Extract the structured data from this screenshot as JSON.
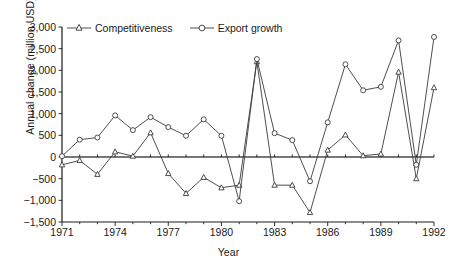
{
  "chart_data": {
    "type": "line",
    "title": "",
    "xlabel": "Year",
    "ylabel": "Annual change (million USD)",
    "xlim": [
      1971,
      1992
    ],
    "ylim": [
      -1500,
      3000
    ],
    "yticks": [
      3000,
      2500,
      2000,
      1500,
      1000,
      500,
      0,
      -500,
      -1000,
      -1500
    ],
    "ytick_labels": [
      "3,000",
      "2,500",
      "2,000",
      "1,500",
      "1,000",
      "500",
      "0",
      "−500",
      "−1,000",
      "−1,500"
    ],
    "xticks": [
      1971,
      1974,
      1977,
      1980,
      1983,
      1986,
      1989,
      1992
    ],
    "xtick_labels": [
      "1971",
      "1974",
      "1977",
      "1980",
      "1983",
      "1986",
      "1989",
      "1992"
    ],
    "grid": false,
    "legend_position": "top-left",
    "zero_line": 0,
    "x": [
      1971,
      1972,
      1973,
      1974,
      1975,
      1976,
      1977,
      1978,
      1979,
      1980,
      1981,
      1982,
      1983,
      1984,
      1985,
      1986,
      1987,
      1988,
      1989,
      1990,
      1991,
      1992
    ],
    "series": [
      {
        "name": "Competitiveness",
        "marker": "triangle",
        "color": "#3a3a3a",
        "values": [
          -180,
          -80,
          -400,
          120,
          20,
          560,
          -380,
          -840,
          -470,
          -710,
          -650,
          2200,
          -650,
          -650,
          -1280,
          160,
          510,
          30,
          70,
          1960,
          -500,
          1600
        ]
      },
      {
        "name": "Export growth",
        "marker": "circle",
        "color": "#3a3a3a",
        "values": [
          20,
          400,
          450,
          960,
          620,
          920,
          690,
          490,
          870,
          490,
          -1020,
          2260,
          550,
          390,
          -560,
          800,
          2140,
          1540,
          1620,
          2690,
          -180,
          2770
        ]
      }
    ]
  },
  "legend": {
    "items": [
      {
        "label": "Competitiveness",
        "marker": "triangle-marker"
      },
      {
        "label": "Export growth",
        "marker": "circle-marker"
      }
    ]
  }
}
